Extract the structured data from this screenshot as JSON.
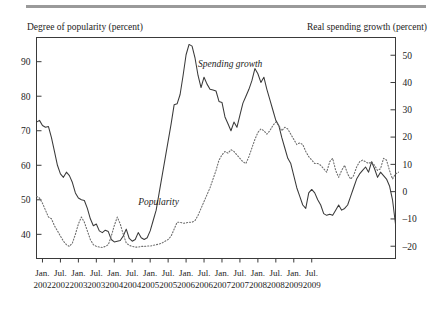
{
  "figure": {
    "left_axis_title": "Degree of popularity (percent)",
    "right_axis_title": "Real spending growth (percent)"
  },
  "chart_data": {
    "type": "line",
    "title": "",
    "subtitle": "",
    "xlabel": "",
    "ylabel": "Degree of popularity (percent)",
    "y2label": "Real spending growth (percent)",
    "grid": false,
    "legend_position": "inline-annotation",
    "ylim": [
      33,
      97
    ],
    "y2lim": [
      -24.5,
      56.5
    ],
    "left_ticks": [
      40,
      50,
      60,
      70,
      80,
      90
    ],
    "right_ticks": [
      -20,
      -10,
      0,
      10,
      20,
      30,
      40,
      50
    ],
    "xlim": [
      "2001-10",
      "2009-08"
    ],
    "x_tick_labels": [
      {
        "month": "Jan.",
        "year": "2002"
      },
      {
        "month": "Jul.",
        "year": "2002"
      },
      {
        "month": "Jan.",
        "year": "2003"
      },
      {
        "month": "Jul.",
        "year": "2003"
      },
      {
        "month": "Jan.",
        "year": "2004"
      },
      {
        "month": "Jul.",
        "year": "2004"
      },
      {
        "month": "Jan.",
        "year": "2005"
      },
      {
        "month": "Jul.",
        "year": "2005"
      },
      {
        "month": "Jan.",
        "year": "2006"
      },
      {
        "month": "Jul.",
        "year": "2006"
      },
      {
        "month": "Jan.",
        "year": "2007"
      },
      {
        "month": "Jul.",
        "year": "2007"
      },
      {
        "month": "Jan.",
        "year": "2008"
      },
      {
        "month": "Jul.",
        "year": "2008"
      },
      {
        "month": "Jan.",
        "year": "2009"
      },
      {
        "month": "Jul.",
        "year": "2009"
      }
    ],
    "annotations": [
      {
        "text": "Spending growth",
        "x_index": 52,
        "y_left": 88.5,
        "axis": "right"
      },
      {
        "text": "Popularity",
        "x_index": 32,
        "y_left": 48.5,
        "axis": "left"
      }
    ],
    "series": [
      {
        "name": "Spending growth",
        "axis": "right",
        "style": "solid",
        "color": "#3a3a3a",
        "label": "Spending growth",
        "x_start": "2001-11",
        "x_step_months": 1,
        "values_left_scale": [
          72.5,
          73.0,
          71.5,
          71.0,
          71.2,
          68.0,
          64.0,
          60.0,
          57.5,
          56.5,
          58.0,
          57.0,
          55.0,
          52.0,
          50.5,
          50.0,
          49.8,
          47.5,
          44.5,
          42.5,
          43.0,
          41.0,
          40.5,
          41.2,
          40.8,
          38.5,
          37.8,
          38.0,
          38.2,
          39.5,
          41.5,
          38.8,
          38.0,
          38.5,
          40.5,
          39.0,
          38.5,
          39.0,
          41.0,
          44.0,
          47.0,
          52.0,
          57.0,
          62.0,
          67.0,
          72.0,
          77.5,
          77.8,
          80.5,
          86.0,
          92.0,
          95.0,
          94.5,
          91.0,
          86.0,
          82.5,
          85.5,
          83.5,
          82.0,
          81.8,
          81.5,
          78.5,
          78.2,
          74.0,
          72.0,
          70.0,
          72.5,
          71.0,
          74.5,
          78.0,
          80.0,
          82.0,
          84.5,
          88.0,
          86.5,
          84.0,
          85.5,
          82.0,
          79.0,
          76.0,
          73.0,
          71.5,
          68.0,
          65.0,
          62.0,
          60.5,
          57.0,
          53.5,
          51.0,
          48.5,
          47.5,
          52.0,
          53.0,
          52.0,
          50.0,
          48.5,
          46.0,
          45.5,
          45.8,
          45.5,
          47.0,
          48.5,
          47.0,
          47.5,
          48.5,
          51.0,
          53.5,
          56.0,
          57.5,
          58.5,
          59.5,
          58.0,
          61.0,
          59.0,
          56.5,
          58.0,
          57.0,
          56.0,
          54.0,
          50.0,
          43.0
        ],
        "values_right_scale": [
          25.0,
          25.5,
          24.0,
          23.5,
          23.7,
          20.8,
          17.2,
          13.5,
          11.2,
          10.3,
          11.7,
          10.8,
          9.0,
          6.3,
          5.0,
          4.5,
          4.3,
          2.1,
          -0.5,
          -2.4,
          -2.0,
          -3.8,
          -4.3,
          -3.6,
          -4.0,
          -6.1,
          -6.8,
          -6.6,
          -6.4,
          -5.2,
          -3.4,
          -6.1,
          -6.8,
          -6.3,
          -4.5,
          -5.9,
          -6.4,
          -5.9,
          -4.0,
          -1.3,
          1.4,
          6.0,
          10.5,
          15.0,
          19.5,
          24.0,
          28.9,
          29.2,
          31.6,
          36.6,
          42.1,
          44.8,
          44.3,
          41.1,
          36.6,
          33.4,
          36.1,
          34.3,
          33.0,
          32.8,
          32.5,
          29.7,
          29.5,
          25.6,
          23.8,
          22.0,
          24.4,
          23.1,
          26.2,
          29.4,
          31.2,
          33.0,
          35.2,
          38.4,
          37.0,
          34.8,
          36.1,
          32.8,
          30.1,
          27.4,
          24.7,
          23.3,
          20.1,
          17.4,
          14.7,
          13.4,
          10.2,
          7.0,
          4.8,
          2.5,
          1.6,
          6.0,
          6.9,
          6.0,
          4.2,
          2.8,
          0.6,
          0.1,
          0.4,
          0.1,
          1.5,
          2.8,
          1.5,
          1.9,
          2.8,
          4.8,
          7.0,
          9.2,
          10.5,
          11.4,
          12.3,
          11.0,
          13.7,
          11.9,
          9.6,
          11.0,
          10.1,
          9.2,
          7.4,
          3.8,
          -2.6
        ]
      },
      {
        "name": "Popularity",
        "axis": "left",
        "style": "dotted",
        "color": "#6e6e6e",
        "label": "Popularity",
        "x_start": "2001-11",
        "x_step_months": 1,
        "values_left_scale": [
          51.0,
          50.5,
          49.0,
          47.0,
          45.0,
          44.5,
          42.5,
          41.0,
          39.5,
          38.0,
          37.0,
          36.5,
          37.5,
          40.0,
          43.0,
          45.0,
          43.5,
          41.0,
          38.5,
          37.0,
          36.5,
          36.3,
          36.2,
          36.5,
          37.0,
          39.5,
          42.5,
          45.0,
          43.0,
          40.0,
          37.5,
          36.8,
          36.5,
          36.3,
          36.3,
          36.5,
          36.5,
          36.6,
          36.6,
          36.8,
          37.0,
          37.2,
          37.5,
          38.0,
          38.5,
          39.5,
          41.5,
          43.5,
          43.5,
          43.2,
          43.3,
          43.5,
          43.5,
          44.0,
          45.5,
          47.5,
          49.5,
          51.5,
          53.5,
          56.0,
          58.5,
          61.5,
          63.0,
          64.0,
          63.5,
          64.5,
          64.0,
          63.0,
          62.0,
          61.0,
          60.5,
          62.5,
          65.0,
          67.5,
          69.5,
          70.5,
          70.0,
          69.0,
          70.0,
          71.5,
          72.5,
          71.5,
          70.0,
          71.0,
          70.5,
          69.0,
          67.5,
          66.0,
          66.5,
          66.0,
          64.0,
          62.5,
          61.5,
          60.5,
          60.5,
          60.0,
          59.0,
          58.0,
          61.0,
          62.0,
          58.5,
          56.5,
          58.5,
          60.0,
          57.5,
          56.0,
          57.0,
          59.5,
          61.0,
          61.5,
          61.0,
          60.5,
          61.0,
          60.0,
          58.5,
          59.0,
          62.0,
          61.5,
          58.5,
          56.0,
          57.5,
          58.0
        ]
      }
    ]
  }
}
